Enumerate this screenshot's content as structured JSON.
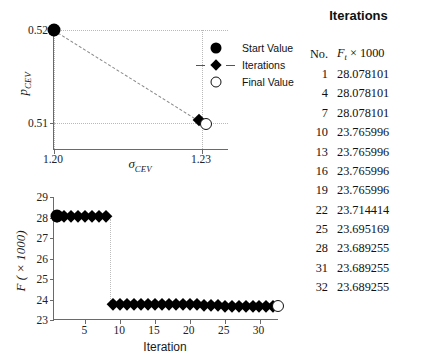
{
  "chart_data": [
    {
      "type": "scatter",
      "id": "parameter-path",
      "title": "",
      "xlabel": "σ_CEV",
      "ylabel": "p_CEV",
      "xlim": [
        1.195,
        1.238
      ],
      "ylim": [
        0.5085,
        0.5208
      ],
      "xticks": [
        1.2,
        1.23
      ],
      "xticklabels": [
        "1.20",
        "1.23"
      ],
      "yticks": [
        0.51,
        0.52
      ],
      "yticklabels": [
        "0.51",
        "0.52"
      ],
      "grid": "dotted",
      "series": [
        {
          "name": "Start Value",
          "marker": "filled-circle",
          "points": [
            {
              "x": 1.2,
              "y": 0.52
            }
          ]
        },
        {
          "name": "Iterations",
          "marker": "diamond",
          "linestyle": "dashed",
          "points": [
            {
              "x": 1.2,
              "y": 0.52
            },
            {
              "x": 1.2295,
              "y": 0.5103
            }
          ]
        },
        {
          "name": "Final Value",
          "marker": "open-circle",
          "points": [
            {
              "x": 1.2305,
              "y": 0.51
            }
          ]
        }
      ],
      "legend_position": "upper-right",
      "legend": [
        "Start Value",
        "Iterations",
        "Final Value"
      ]
    },
    {
      "type": "line",
      "id": "objective-convergence",
      "title": "",
      "xlabel": "Iteration",
      "ylabel": "F ( × 1000)",
      "xlim": [
        0.5,
        32.8
      ],
      "ylim": [
        23,
        29
      ],
      "xticks": [
        5,
        10,
        15,
        20,
        25,
        30
      ],
      "xticklabels": [
        "5",
        "10",
        "15",
        "20",
        "25",
        "30"
      ],
      "yticks": [
        23,
        24,
        25,
        26,
        27,
        28,
        29
      ],
      "yticklabels": [
        "23",
        "24",
        "25",
        "26",
        "27",
        "28",
        "29"
      ],
      "grid": "none",
      "linestyle": "dotted",
      "x": [
        1,
        2,
        3,
        4,
        5,
        6,
        7,
        8,
        9,
        10,
        11,
        12,
        13,
        14,
        15,
        16,
        17,
        18,
        19,
        20,
        21,
        22,
        23,
        24,
        25,
        26,
        27,
        28,
        29,
        30,
        31,
        32
      ],
      "values": [
        28.078101,
        28.078101,
        28.078101,
        28.078101,
        28.078101,
        28.078101,
        28.078101,
        28.078101,
        23.765996,
        23.765996,
        23.765996,
        23.765996,
        23.765996,
        23.765996,
        23.765996,
        23.765996,
        23.765996,
        23.765996,
        23.765996,
        23.765996,
        23.765996,
        23.714414,
        23.714414,
        23.714414,
        23.695169,
        23.695169,
        23.695169,
        23.689255,
        23.689255,
        23.689255,
        23.689255,
        23.689255
      ],
      "start_marker": {
        "x": 1,
        "y": 28.078101,
        "marker": "filled-circle"
      },
      "final_marker": {
        "x": 32,
        "y": 23.689255,
        "marker": "open-circle"
      }
    }
  ],
  "top_chart": {
    "ylabel_main": "p",
    "ylabel_sub": "CEV",
    "xlabel_main": "σ",
    "xlabel_sub": "CEV",
    "xticklabels": [
      "1.20",
      "1.23"
    ],
    "yticklabels": [
      "0.51",
      "0.52"
    ],
    "legend": [
      {
        "label": "Start Value",
        "glyph": "filled-circle-icon"
      },
      {
        "label": "Iterations",
        "glyph": "diamond-dashed-icon"
      },
      {
        "label": "Final Value",
        "glyph": "open-circle-icon"
      }
    ]
  },
  "bottom_chart": {
    "ylabel": "F ( × 1000)",
    "xlabel": "Iteration",
    "xticklabels": [
      "5",
      "10",
      "15",
      "20",
      "25",
      "30"
    ],
    "yticklabels": [
      "23",
      "24",
      "25",
      "26",
      "27",
      "28",
      "29"
    ]
  },
  "table": {
    "title": "Iterations",
    "header_no": "No.",
    "header_value_main": "F",
    "header_value_sub": "t",
    "header_value_rest": " × 1000",
    "rows": [
      {
        "no": "1",
        "value": "28.078101"
      },
      {
        "no": "4",
        "value": "28.078101"
      },
      {
        "no": "7",
        "value": "28.078101"
      },
      {
        "no": "10",
        "value": "23.765996"
      },
      {
        "no": "13",
        "value": "23.765996"
      },
      {
        "no": "16",
        "value": "23.765996"
      },
      {
        "no": "19",
        "value": "23.765996"
      },
      {
        "no": "22",
        "value": "23.714414"
      },
      {
        "no": "25",
        "value": "23.695169"
      },
      {
        "no": "28",
        "value": "23.689255"
      },
      {
        "no": "31",
        "value": "23.689255"
      },
      {
        "no": "32",
        "value": "23.689255"
      }
    ]
  },
  "colors": {
    "marker": "#000000",
    "axis": "#6a6a6a",
    "grid": "#b9b9b9",
    "dash": "#8a8a8a",
    "background": "#ffffff"
  }
}
